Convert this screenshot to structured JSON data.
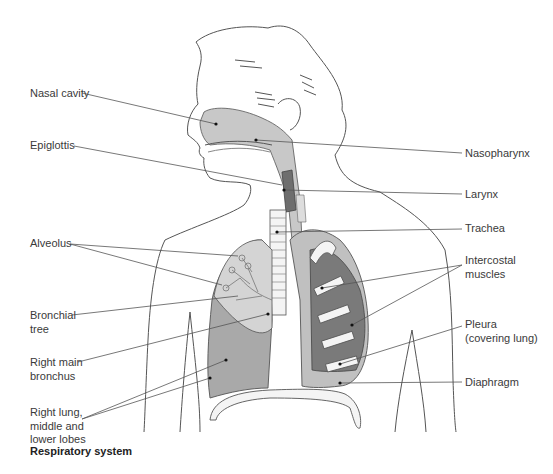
{
  "figure": {
    "caption": "Respiratory system",
    "colors": {
      "outline": "#555555",
      "airway_light": "#c8c8c8",
      "upper_lobe": "#d4d4d4",
      "lower_lobes": "#a9a9a9",
      "muscle_dark": "#7a7a7a",
      "larynx_dark": "#6e6e6e",
      "rib_white": "#f4f4f4"
    },
    "labels_left": [
      {
        "id": "nasal-cavity",
        "text": "Nasal cavity"
      },
      {
        "id": "epiglottis",
        "text": "Epiglottis"
      },
      {
        "id": "alveolus",
        "text": "Alveolus"
      },
      {
        "id": "bronchial-tree",
        "line1": "Bronchial",
        "line2": "tree"
      },
      {
        "id": "right-main-bronchus",
        "line1": "Right main",
        "line2": "bronchus"
      },
      {
        "id": "right-lung",
        "line1": "Right lung,",
        "line2": "middle and",
        "line3": "lower lobes"
      }
    ],
    "labels_right": [
      {
        "id": "nasopharynx",
        "text": "Nasopharynx"
      },
      {
        "id": "larynx",
        "text": "Larynx"
      },
      {
        "id": "trachea",
        "text": "Trachea"
      },
      {
        "id": "intercostal-muscles",
        "line1": "Intercostal",
        "line2": "muscles"
      },
      {
        "id": "pleura",
        "line1": "Pleura",
        "line2": "(covering lung)"
      },
      {
        "id": "diaphragm",
        "text": "Diaphragm"
      }
    ]
  }
}
